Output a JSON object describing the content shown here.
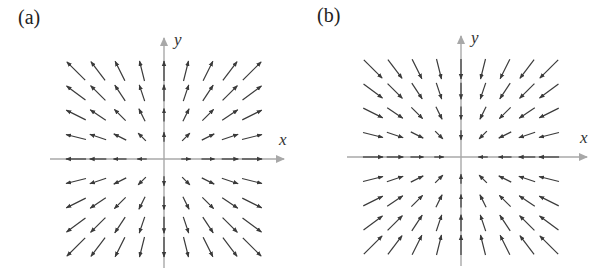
{
  "colors": {
    "axis": "#a8a8a8",
    "arrow": "#3a3a3a",
    "background": "#ffffff"
  },
  "panels": [
    {
      "id": "a",
      "label": "(a)",
      "x_axis_label": "x",
      "y_axis_label": "y",
      "field": "F(x,y) = (x, y)",
      "direction": "outward",
      "origin": [
        164,
        159
      ],
      "x_axis": [
        50,
        284
      ],
      "y_axis": [
        38,
        268
      ],
      "label_pos": [
        18,
        28
      ],
      "xlabel_pos": [
        279,
        130
      ],
      "ylabel_pos": [
        174,
        30
      ]
    },
    {
      "id": "b",
      "label": "(b)",
      "x_axis_label": "x",
      "y_axis_label": "y",
      "field": "F(x,y) = (-x, -y)",
      "direction": "inward",
      "origin": [
        461,
        157
      ],
      "x_axis": [
        347,
        587
      ],
      "y_axis": [
        36,
        266
      ],
      "label_pos": [
        317,
        26
      ],
      "xlabel_pos": [
        580,
        128
      ],
      "ylabel_pos": [
        471,
        28
      ]
    }
  ],
  "grid": {
    "steps": [
      -4,
      -3,
      -2,
      -1,
      0,
      1,
      2,
      3,
      4
    ],
    "spacing": 22,
    "max_length": 26
  }
}
